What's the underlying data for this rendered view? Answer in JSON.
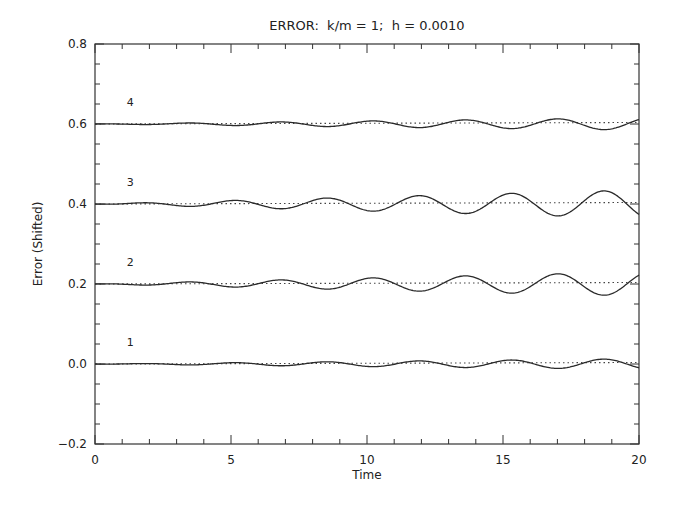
{
  "chart_data": {
    "type": "line",
    "title": "ERROR:  k/m = 1;  h = 0.0010",
    "xlabel": "Time",
    "ylabel": "Error (Shifted)",
    "xlim": [
      0,
      20
    ],
    "ylim": [
      -0.2,
      0.8
    ],
    "xticks": [
      0,
      5,
      10,
      15,
      20
    ],
    "xtick_labels": [
      "0",
      "5",
      "10",
      "15",
      "20"
    ],
    "yticks": [
      -0.2,
      0.0,
      0.2,
      0.4,
      0.6,
      0.8
    ],
    "ytick_labels": [
      "−0.2",
      "0.0",
      "0.2",
      "0.4",
      "0.6",
      "0.8"
    ],
    "x_minor_step": 1,
    "y_minor_step": 0.05,
    "grid": false,
    "legend": "none (inline labels 1-4 near left of each curve)",
    "reference_lines": [
      {
        "name": "baseline-1",
        "y": 0.0,
        "style": "dotted"
      },
      {
        "name": "baseline-2",
        "y": 0.2,
        "style": "dotted"
      },
      {
        "name": "baseline-3",
        "y": 0.4,
        "style": "dotted"
      },
      {
        "name": "baseline-4",
        "y": 0.6,
        "style": "dotted"
      }
    ],
    "series": [
      {
        "name": "1",
        "label_x": 1.3,
        "label_y": 0.045,
        "offset": 0.0,
        "amplitude_end": 0.013,
        "period": 3.4,
        "phase_peak": 1.7
      },
      {
        "name": "2",
        "label_x": 1.3,
        "label_y": 0.245,
        "offset": 0.2,
        "amplitude_end": 0.03,
        "period": 3.4,
        "phase_peak": 3.4
      },
      {
        "name": "3",
        "label_x": 1.3,
        "label_y": 0.445,
        "offset": 0.4,
        "amplitude_end": 0.035,
        "period": 3.4,
        "phase_peak": 1.7
      },
      {
        "name": "4",
        "label_x": 1.3,
        "label_y": 0.645,
        "offset": 0.6,
        "amplitude_end": 0.015,
        "period": 3.4,
        "phase_peak": 3.4
      }
    ]
  },
  "plot_area": {
    "left": 95,
    "top": 44,
    "right": 639,
    "bottom": 444
  },
  "colors": {
    "line": "#2a2a2a",
    "axis": "#333333",
    "dotted": "#444444",
    "background": "#ffffff"
  }
}
